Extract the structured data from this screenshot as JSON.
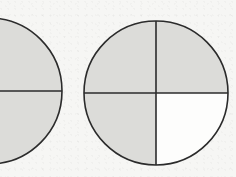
{
  "figure": {
    "type": "fraction-circle-diagram",
    "background_color": "#f6f6f4",
    "shade_color": "#dcdcd9",
    "unshaded_color": "#fdfdfc",
    "stroke_color": "#2b2b2b",
    "stroke_width": 1.6,
    "shapes": [
      {
        "id": "left-circle",
        "name": "Left circle",
        "center_x": -11,
        "center_y": 91,
        "radius": 73,
        "partitions": 2,
        "partition_type": "horizontal-diameter",
        "shaded_parts": 2,
        "total_parts": 2,
        "fraction_label": "2/2",
        "clipped_at_left_edge": true,
        "sectors": [
          {
            "id": "left-top-half",
            "name": "top half",
            "shaded": true
          },
          {
            "id": "left-bottom-half",
            "name": "bottom half",
            "shaded": true
          }
        ],
        "dividers": [
          {
            "id": "left-horizontal-diameter",
            "orientation": "horizontal"
          }
        ]
      },
      {
        "id": "right-circle",
        "name": "Right circle",
        "center_x": 156,
        "center_y": 93,
        "radius": 72,
        "partitions": 4,
        "partition_type": "horizontal-and-vertical-diameters",
        "shaded_parts": 3,
        "total_parts": 4,
        "fraction_label": "3/4",
        "clipped_at_left_edge": false,
        "sectors": [
          {
            "id": "right-top-left-quadrant",
            "name": "top-left quadrant",
            "shaded": true
          },
          {
            "id": "right-top-right-quadrant",
            "name": "top-right quadrant",
            "shaded": true
          },
          {
            "id": "right-bottom-left-quadrant",
            "name": "bottom-left quadrant",
            "shaded": true
          },
          {
            "id": "right-bottom-right-quadrant",
            "name": "bottom-right quadrant",
            "shaded": false
          }
        ],
        "dividers": [
          {
            "id": "right-horizontal-diameter",
            "orientation": "horizontal"
          },
          {
            "id": "right-vertical-diameter",
            "orientation": "vertical"
          }
        ]
      }
    ]
  }
}
